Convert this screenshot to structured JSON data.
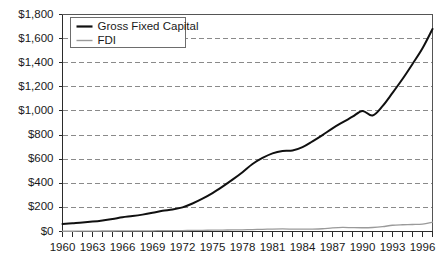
{
  "chart_data": {
    "type": "line",
    "title": "",
    "subtitle": "",
    "xlabel": "",
    "ylabel": "",
    "grid": true,
    "legend_position": "top-left-inside",
    "ylim": [
      0,
      1800
    ],
    "xlim": [
      1960,
      1997
    ],
    "y_ticks": [
      0,
      200,
      400,
      600,
      800,
      1000,
      1200,
      1400,
      1600,
      1800
    ],
    "y_tick_labels": [
      "$0",
      "$200",
      "$400",
      "$600",
      "$800",
      "$1,000",
      "$1,200",
      "$1,400",
      "$1,600",
      "$1,800"
    ],
    "x": [
      1960,
      1961,
      1962,
      1963,
      1964,
      1965,
      1966,
      1967,
      1968,
      1969,
      1970,
      1971,
      1972,
      1973,
      1974,
      1975,
      1976,
      1977,
      1978,
      1979,
      1980,
      1981,
      1982,
      1983,
      1984,
      1985,
      1986,
      1987,
      1988,
      1989,
      1990,
      1991,
      1992,
      1993,
      1994,
      1995,
      1996,
      1997
    ],
    "x_tick_labels": [
      "1960",
      "1963",
      "1966",
      "1969",
      "1972",
      "1975",
      "1978",
      "1981",
      "1984",
      "1987",
      "1990",
      "1993",
      "1996"
    ],
    "x_tick_years": [
      1960,
      1963,
      1966,
      1969,
      1972,
      1975,
      1978,
      1981,
      1984,
      1987,
      1990,
      1993,
      1996
    ],
    "series": [
      {
        "name": "Gross Fixed Capital",
        "color": "#101010",
        "width": 2,
        "values": [
          62,
          68,
          74,
          82,
          92,
          104,
          118,
          128,
          140,
          155,
          172,
          182,
          200,
          232,
          272,
          318,
          372,
          430,
          492,
          560,
          610,
          648,
          668,
          672,
          700,
          748,
          800,
          856,
          905,
          952,
          1000,
          962,
          1040,
          1150,
          1265,
          1390,
          1520,
          1680
        ]
      },
      {
        "name": "FDI",
        "color": "#9a9a9a",
        "width": 1.3,
        "values": [
          2,
          2,
          3,
          3,
          4,
          4,
          5,
          5,
          6,
          6,
          7,
          7,
          8,
          9,
          10,
          11,
          12,
          13,
          14,
          16,
          18,
          20,
          21,
          20,
          19,
          20,
          23,
          30,
          34,
          32,
          31,
          33,
          40,
          52,
          56,
          58,
          62,
          78
        ]
      }
    ]
  },
  "legend": {
    "entries": [
      {
        "label": "Gross Fixed Capital",
        "swatch": "thick-black-line"
      },
      {
        "label": "FDI",
        "swatch": "thin-gray-line"
      }
    ]
  },
  "colors": {
    "background": "#ffffff",
    "gridline": "#8a8a8a",
    "axis": "#2b2b2b",
    "series_main": "#101010",
    "series_secondary": "#9a9a9a",
    "text": "#1a1a1a"
  }
}
